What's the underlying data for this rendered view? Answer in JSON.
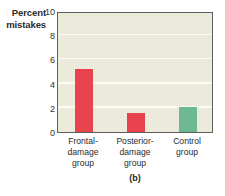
{
  "chart_data": {
    "type": "bar",
    "title": "",
    "subtitle": "",
    "caption": "(b)",
    "xlabel": "",
    "ylabel": "Percent mistakes",
    "ylabel_lines": [
      "Percent",
      "mistakes"
    ],
    "categories": [
      "Frontal-damage group",
      "Posterior-damage group",
      "Control group"
    ],
    "category_lines": [
      [
        "Frontal-",
        "damage",
        "group"
      ],
      [
        "Posterior-",
        "damage",
        "group"
      ],
      [
        "Control",
        "group"
      ]
    ],
    "values": [
      5.2,
      1.6,
      2.1
    ],
    "bar_colors": [
      "#e8434c",
      "#e8434c",
      "#6fb894"
    ],
    "ylim": [
      0,
      10
    ],
    "yticks": [
      0,
      2,
      4,
      6,
      8,
      10
    ],
    "ytick_labels": [
      "0",
      "2",
      "4",
      "6",
      "8",
      "10"
    ],
    "grid": true,
    "gridlines_at": [
      2,
      4,
      6,
      8
    ],
    "legend": null,
    "plot_background": "#eceadb",
    "gridline_color": "#fbfaf4",
    "axis_color": "#5e5e5e"
  }
}
